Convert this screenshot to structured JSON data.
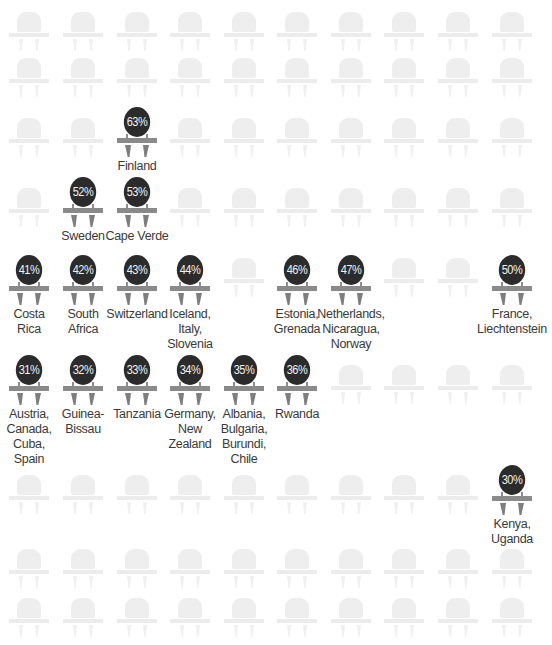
{
  "chart_data": {
    "type": "pictograph",
    "title": "",
    "grid": {
      "columns": 10,
      "rows": 9
    },
    "series": [
      {
        "value": "63%",
        "countries": [
          "Finland"
        ]
      },
      {
        "value": "53%",
        "countries": [
          "Cape Verde"
        ]
      },
      {
        "value": "52%",
        "countries": [
          "Sweden"
        ]
      },
      {
        "value": "50%",
        "countries": [
          "France",
          "Liechtenstein"
        ]
      },
      {
        "value": "47%",
        "countries": [
          "Netherlands",
          "Nicaragua",
          "Norway"
        ]
      },
      {
        "value": "46%",
        "countries": [
          "Estonia",
          "Grenada"
        ]
      },
      {
        "value": "44%",
        "countries": [
          "Iceland",
          "Italy",
          "Slovenia"
        ]
      },
      {
        "value": "43%",
        "countries": [
          "Switzerland"
        ]
      },
      {
        "value": "42%",
        "countries": [
          "South Africa"
        ]
      },
      {
        "value": "41%",
        "countries": [
          "Costa Rica"
        ]
      },
      {
        "value": "36%",
        "countries": [
          "Rwanda"
        ]
      },
      {
        "value": "35%",
        "countries": [
          "Albania",
          "Bulgaria",
          "Burundi",
          "Chile"
        ]
      },
      {
        "value": "34%",
        "countries": [
          "Germany",
          "New Zealand"
        ]
      },
      {
        "value": "33%",
        "countries": [
          "Tanzania"
        ]
      },
      {
        "value": "32%",
        "countries": [
          "Guinea-Bissau"
        ]
      },
      {
        "value": "31%",
        "countries": [
          "Austria",
          "Canada",
          "Cuba",
          "Spain"
        ]
      },
      {
        "value": "30%",
        "countries": [
          "Kenya",
          "Uganda"
        ]
      }
    ]
  },
  "colors": {
    "background": "#ffffff",
    "ghost_chair": "#eeeeee",
    "disc": "#2b2b2b",
    "disc_text": "#f2f2f2",
    "chair_frame": "#8a8a8a",
    "label_text": "#3a3a3a"
  },
  "layout": {
    "column_x": [
      29,
      83,
      137,
      190,
      244,
      297,
      351,
      404,
      458,
      512
    ],
    "ghost_rows": [
      {
        "y": 12,
        "cols": [
          0,
          1,
          2,
          3,
          4,
          5,
          6,
          7,
          8,
          9
        ]
      },
      {
        "y": 58,
        "cols": [
          0,
          1,
          2,
          3,
          4,
          5,
          6,
          7,
          8,
          9
        ]
      },
      {
        "y": 118,
        "cols": [
          0,
          1,
          3,
          4,
          5,
          6,
          7,
          8,
          9
        ]
      },
      {
        "y": 188,
        "cols": [
          0,
          3,
          4,
          5,
          6,
          7,
          8,
          9
        ]
      },
      {
        "y": 258,
        "cols": [
          4,
          7,
          8
        ]
      },
      {
        "y": 365,
        "cols": [
          6,
          7,
          8,
          9
        ]
      },
      {
        "y": 475,
        "cols": [
          0,
          1,
          2,
          3,
          4,
          5,
          6,
          7,
          8
        ]
      },
      {
        "y": 549,
        "cols": [
          0,
          1,
          2,
          3,
          4,
          5,
          6,
          7,
          8,
          9
        ]
      },
      {
        "y": 598,
        "cols": [
          0,
          1,
          2,
          3,
          4,
          5,
          6,
          7,
          8,
          9
        ]
      }
    ],
    "highlighted": [
      {
        "col": 2,
        "y": 107,
        "label": [
          "Finland"
        ],
        "value": "63%"
      },
      {
        "col": 1,
        "y": 177,
        "label": [
          "Sweden"
        ],
        "value": "52%"
      },
      {
        "col": 2,
        "y": 177,
        "label": [
          "Cape Verde"
        ],
        "value": "53%"
      },
      {
        "col": 0,
        "y": 255,
        "label": [
          "Costa",
          "Rica"
        ],
        "value": "41%"
      },
      {
        "col": 1,
        "y": 255,
        "label": [
          "South",
          "Africa"
        ],
        "value": "42%"
      },
      {
        "col": 2,
        "y": 255,
        "label": [
          "Switzerland"
        ],
        "value": "43%"
      },
      {
        "col": 3,
        "y": 255,
        "label": [
          "Iceland,",
          "Italy,",
          "Slovenia"
        ],
        "value": "44%"
      },
      {
        "col": 5,
        "y": 255,
        "label": [
          "Estonia,",
          "Grenada"
        ],
        "value": "46%"
      },
      {
        "col": 6,
        "y": 255,
        "label": [
          "Netherlands,",
          "Nicaragua,",
          "Norway"
        ],
        "value": "47%"
      },
      {
        "col": 9,
        "y": 255,
        "label": [
          "France,",
          "Liechtenstein"
        ],
        "value": "50%"
      },
      {
        "col": 0,
        "y": 355,
        "label": [
          "Austria,",
          "Canada,",
          "Cuba,",
          "Spain"
        ],
        "value": "31%"
      },
      {
        "col": 1,
        "y": 355,
        "label": [
          "Guinea-",
          "Bissau"
        ],
        "value": "32%"
      },
      {
        "col": 2,
        "y": 355,
        "label": [
          "Tanzania"
        ],
        "value": "33%"
      },
      {
        "col": 3,
        "y": 355,
        "label": [
          "Germany,",
          "New",
          "Zealand"
        ],
        "value": "34%"
      },
      {
        "col": 4,
        "y": 355,
        "label": [
          "Albania,",
          "Bulgaria,",
          "Burundi,",
          "Chile"
        ],
        "value": "35%"
      },
      {
        "col": 5,
        "y": 355,
        "label": [
          "Rwanda"
        ],
        "value": "36%"
      },
      {
        "col": 9,
        "y": 465,
        "label": [
          "Kenya,",
          "Uganda"
        ],
        "value": "30%"
      }
    ]
  }
}
